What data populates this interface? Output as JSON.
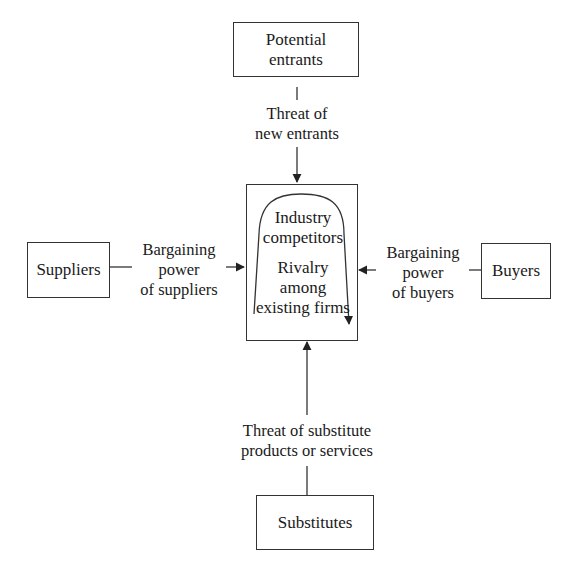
{
  "diagram": {
    "nodes": {
      "potential_entrants": {
        "line1": "Potential",
        "line2": "entrants"
      },
      "suppliers": {
        "label": "Suppliers"
      },
      "buyers": {
        "label": "Buyers"
      },
      "substitutes": {
        "label": "Substitutes"
      },
      "industry": {
        "heading1": "Industry",
        "heading2": "competitors",
        "rivalry1": "Rivalry",
        "rivalry2": "among",
        "rivalry3": "existing firms"
      }
    },
    "forces": {
      "new_entrants": {
        "line1": "Threat of",
        "line2": "new entrants"
      },
      "suppliers": {
        "line1": "Bargaining",
        "line2": "power",
        "line3": "of suppliers"
      },
      "buyers": {
        "line1": "Bargaining",
        "line2": "power",
        "line3": "of buyers"
      },
      "substitutes": {
        "line1": "Threat of substitute",
        "line2": "products or services"
      }
    },
    "colors": {
      "stroke": "#333333",
      "text": "#1a1a1a",
      "background": "#ffffff"
    }
  }
}
